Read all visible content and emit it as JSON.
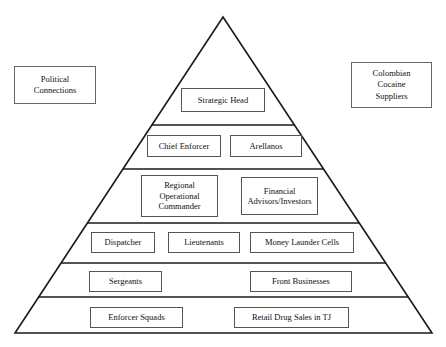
{
  "diagram": {
    "type": "pyramid-hierarchy",
    "title": "",
    "geometry": {
      "apex_x": 223,
      "apex_y": 17,
      "base_left_x": 15,
      "base_right_x": 432,
      "base_y": 333,
      "divider_y": [
        125,
        169,
        223,
        263,
        297
      ]
    },
    "stroke_color": "#1a1a1a",
    "box_border_color": "#555555",
    "background_color": "#ffffff",
    "tiers": [
      {
        "level": 1,
        "boxes": [
          {
            "label": "Strategic Head",
            "x": 181,
            "y": 88,
            "w": 84,
            "h": 24
          }
        ]
      },
      {
        "level": 2,
        "boxes": [
          {
            "label": "Chief Enforcer",
            "x": 147,
            "y": 135,
            "w": 74,
            "h": 22
          },
          {
            "label": "Arellanos",
            "x": 230,
            "y": 135,
            "w": 72,
            "h": 22
          }
        ]
      },
      {
        "level": 3,
        "boxes": [
          {
            "label": "Regional\nOperational\nCommander",
            "x": 141,
            "y": 175,
            "w": 77,
            "h": 42
          },
          {
            "label": "Financial\nAdvisors/Investors",
            "x": 241,
            "y": 177,
            "w": 77,
            "h": 38
          }
        ]
      },
      {
        "level": 4,
        "boxes": [
          {
            "label": "Dispatcher",
            "x": 91,
            "y": 232,
            "w": 64,
            "h": 21
          },
          {
            "label": "Lieutenants",
            "x": 168,
            "y": 232,
            "w": 72,
            "h": 21
          },
          {
            "label": "Money Launder Cells",
            "x": 250,
            "y": 232,
            "w": 104,
            "h": 21
          }
        ]
      },
      {
        "level": 5,
        "boxes": [
          {
            "label": "Sergeants",
            "x": 89,
            "y": 271,
            "w": 73,
            "h": 21
          },
          {
            "label": "Front Businesses",
            "x": 250,
            "y": 271,
            "w": 102,
            "h": 21
          }
        ]
      },
      {
        "level": 6,
        "boxes": [
          {
            "label": "Enforcer Squads",
            "x": 90,
            "y": 307,
            "w": 93,
            "h": 21
          },
          {
            "label": "Retail Drug Sales in TJ",
            "x": 234,
            "y": 307,
            "w": 115,
            "h": 21
          }
        ]
      }
    ],
    "side_boxes": [
      {
        "name": "political-connections",
        "label": "Political\nConnections",
        "x": 14,
        "y": 66,
        "w": 82,
        "h": 38
      },
      {
        "name": "colombian-cocaine-suppliers",
        "label": "Colombian\nCocaine\nSuppliers",
        "x": 351,
        "y": 62,
        "w": 81,
        "h": 46
      }
    ]
  }
}
